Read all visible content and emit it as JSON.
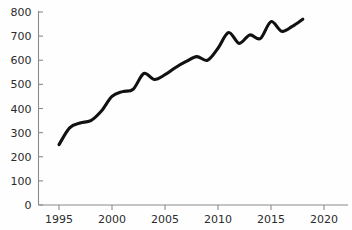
{
  "chart_data": {
    "type": "line",
    "title": "",
    "subtitle": "",
    "xlabel": "",
    "ylabel": "",
    "xlim": [
      1992.5,
      2023.0
    ],
    "ylim": [
      0,
      800
    ],
    "grid": false,
    "legend": null,
    "x_ticks": [
      1995,
      2000,
      2005,
      2010,
      2015,
      2020
    ],
    "x_tick_labels": [
      "1995",
      "2000",
      "2005",
      "2010",
      "2015",
      "2020"
    ],
    "y_ticks": [
      0,
      100,
      200,
      300,
      400,
      500,
      600,
      700,
      800
    ],
    "y_tick_labels": [
      "0",
      "100",
      "200",
      "300",
      "400",
      "500",
      "600",
      "700",
      "800"
    ],
    "series": [
      {
        "name": "series-1",
        "color": "#111111",
        "x": [
          1995,
          1996,
          1997,
          1998,
          1999,
          2000,
          2001,
          2002,
          2003,
          2004,
          2005,
          2006,
          2007,
          2008,
          2009,
          2010,
          2011,
          2012,
          2013,
          2014,
          2015,
          2016,
          2017,
          2018
        ],
        "values": [
          250,
          320,
          340,
          350,
          390,
          450,
          470,
          480,
          545,
          520,
          540,
          570,
          595,
          615,
          600,
          650,
          715,
          670,
          705,
          690,
          760,
          720,
          740,
          770
        ]
      }
    ]
  },
  "axes": {
    "y_axis_name": "y-axis",
    "x_axis_name": "x-axis"
  },
  "colors": {
    "line": "#111111",
    "axis": "#8a8a8a",
    "text": "#2b2b2b",
    "background": "#fefefe"
  }
}
